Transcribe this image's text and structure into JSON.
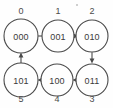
{
  "diagram": {
    "background_color": "#fefefe",
    "stroke_color": "#4a4a4a",
    "text_color": "#3a3a3a",
    "nodes": [
      {
        "index_label": "0",
        "code_label": "000",
        "cx": 21,
        "cy": 36,
        "r": 17,
        "index_x": 21,
        "index_y": 11
      },
      {
        "index_label": "1",
        "code_label": "001",
        "cx": 58,
        "cy": 36,
        "r": 16,
        "index_x": 58,
        "index_y": 11
      },
      {
        "index_label": "2",
        "code_label": "010",
        "cx": 92,
        "cy": 36,
        "r": 16,
        "index_x": 92,
        "index_y": 11
      },
      {
        "index_label": "3",
        "code_label": "011",
        "cx": 92,
        "cy": 80,
        "r": 16,
        "index_x": 92,
        "index_y": 99
      },
      {
        "index_label": "4",
        "code_label": "100",
        "cx": 57,
        "cy": 80,
        "r": 16,
        "index_x": 57,
        "index_y": 99
      },
      {
        "index_label": "5",
        "code_label": "101",
        "cx": 21,
        "cy": 80,
        "r": 17,
        "index_x": 21,
        "index_y": 99
      }
    ],
    "edges": [
      {
        "from": "000",
        "to": "001",
        "direction": "right"
      },
      {
        "from": "001",
        "to": "010",
        "direction": "right"
      },
      {
        "from": "010",
        "to": "011",
        "direction": "down"
      },
      {
        "from": "011",
        "to": "100",
        "direction": "left"
      },
      {
        "from": "100",
        "to": "101",
        "direction": "left"
      },
      {
        "from": "101",
        "to": "000",
        "direction": "up"
      }
    ]
  }
}
